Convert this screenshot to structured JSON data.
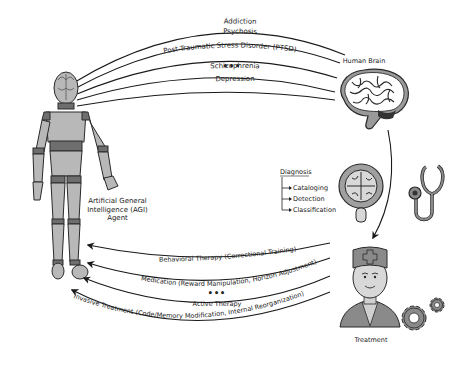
{
  "diagram": {
    "disorders": [
      {
        "label": "Addiction"
      },
      {
        "label": "Psychosis"
      },
      {
        "label": "Post-Traumatic Stress Disorder (PTSD)"
      },
      {
        "label": "•••"
      },
      {
        "label": "Schizophrenia"
      },
      {
        "label": "Depression"
      }
    ],
    "human_brain": {
      "label": "Human Brain",
      "icon": "brain-icon"
    },
    "agent": {
      "label_lines": [
        "Artificial General",
        "Intelligence (AGI)",
        "Agent"
      ],
      "icon": "mannequin-icon"
    },
    "diagnosis": {
      "title": "Diagnosis",
      "items": [
        "Cataloging",
        "Detection",
        "Classification"
      ],
      "icons": [
        "magnifier-brain-icon",
        "stethoscope-icon"
      ]
    },
    "treatment": {
      "label": "Treatment",
      "icons": [
        "doctor-icon",
        "gears-icon"
      ]
    },
    "therapies": [
      {
        "label": "Behavioral Therapy (Correctional Training)"
      },
      {
        "label": "Medication (Reward Manipulation, Horizon Adjustment)"
      },
      {
        "label": "•••"
      },
      {
        "label": "Active Therapy"
      },
      {
        "label": "Invasive Treatment (Code/Memory Modification, Internal Reorganization)"
      }
    ],
    "colors": {
      "line": "#1a1a1a",
      "fill_light": "#b8b8b8",
      "fill_dark": "#6e6e6e",
      "background": "#ffffff"
    }
  }
}
